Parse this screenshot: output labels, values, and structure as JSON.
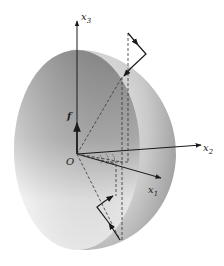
{
  "figure": {
    "labels": {
      "x3": "x",
      "x3_sub": "3",
      "x2": "x",
      "x2_sub": "2",
      "x1": "x",
      "x1_sub": "1",
      "origin": "O",
      "force": "f"
    },
    "colors": {
      "background": "#ffffff",
      "line": "#1a1a1a",
      "shell_light": "#d8d8d8",
      "shell_dark": "#8a8a8a",
      "disc_light": "#e6e6e6",
      "disc_dark": "#8c8c8c"
    }
  }
}
